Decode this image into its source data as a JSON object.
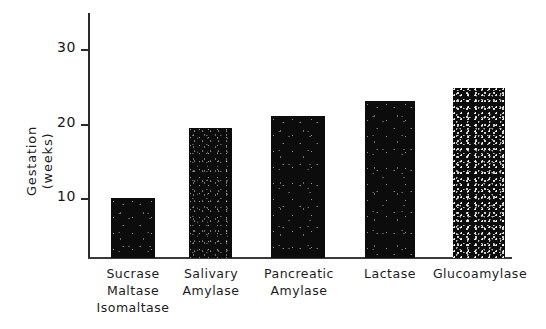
{
  "chart_data": {
    "type": "bar",
    "title": "",
    "xlabel": "",
    "ylabel": "Gestation (weeks)",
    "ylabel_lines": [
      "Gestation",
      "(weeks)"
    ],
    "categories": [
      "Sucrase Maltase Isomaltase",
      "Salivary Amylase",
      "Pancreatic Amylase",
      "Lactase",
      "Glucoamylase"
    ],
    "category_lines": [
      [
        "Sucrase",
        "Maltase",
        "Isomaltase"
      ],
      [
        "Salivary",
        "Amylase"
      ],
      [
        "Pancreatic",
        "Amylase"
      ],
      [
        "Lactase"
      ],
      [
        "Glucoamylase"
      ]
    ],
    "values": [
      10,
      19.5,
      21,
      23,
      24.8
    ],
    "ylim": [
      2,
      35
    ],
    "yticks": [
      10,
      20,
      30
    ],
    "ytick_labels": [
      "10",
      "20",
      "30"
    ],
    "grid": false,
    "legend": false,
    "bar_color": "#0c0c0c",
    "axis_color": "#2b2b2b",
    "background": "#ffffff"
  },
  "axis": {
    "ytick_10": "10",
    "ytick_20": "20",
    "ytick_30": "30"
  }
}
